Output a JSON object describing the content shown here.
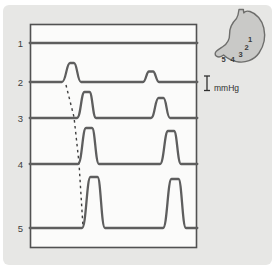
{
  "figure": {
    "colors": {
      "canvas_bg": "#e7e7e5",
      "chart_bg": "#fbfbfa",
      "panel_border": "#515151",
      "trace": "#5e5e5e",
      "dashed_line": "#3f3f3f",
      "text": "#3d3d3d",
      "stomach_fill": "#c9c9c7",
      "stomach_stroke": "#6e6e6c"
    },
    "stomach": {
      "numbers": [
        {
          "label": "1",
          "x": 250.0,
          "y": 41.5
        },
        {
          "label": "2",
          "x": 246.5,
          "y": 50.0
        },
        {
          "label": "3",
          "x": 240.5,
          "y": 57.0
        },
        {
          "label": "4",
          "x": 232.5,
          "y": 61.5
        },
        {
          "label": "5",
          "x": 223.5,
          "y": 61.5
        }
      ]
    },
    "scale_bar": {
      "label": "mmHg",
      "x": 207,
      "y1": 76,
      "y2": 90.5,
      "cap_half_width": 3,
      "label_x": 214,
      "label_y": 91
    }
  },
  "chart_data": {
    "type": "line",
    "title": "",
    "panel": {
      "x0": 30.5,
      "y0": 24.5,
      "x1": 196.5,
      "y1": 247.5
    },
    "traces": [
      {
        "site": "1",
        "label": "1",
        "baseline_y": 43,
        "waves": []
      },
      {
        "site": "2",
        "label": "2",
        "baseline_y": 82,
        "waves": [
          {
            "center_x": 72,
            "amplitude": 19,
            "half_width_left": 10,
            "half_width_right": 9,
            "crest": 2
          },
          {
            "center_x": 151,
            "amplitude": 10.5,
            "half_width_left": 8,
            "half_width_right": 8,
            "crest": 2
          }
        ]
      },
      {
        "site": "3",
        "label": "3",
        "baseline_y": 118,
        "waves": [
          {
            "center_x": 87,
            "amplitude": 26,
            "half_width_left": 10,
            "half_width_right": 9,
            "crest": 2.5
          },
          {
            "center_x": 161,
            "amplitude": 20,
            "half_width_left": 10,
            "half_width_right": 9,
            "crest": 2.5
          }
        ]
      },
      {
        "site": "4",
        "label": "4",
        "baseline_y": 164,
        "waves": [
          {
            "center_x": 89,
            "amplitude": 36,
            "half_width_left": 11,
            "half_width_right": 10,
            "crest": 3
          },
          {
            "center_x": 171,
            "amplitude": 33,
            "half_width_left": 11,
            "half_width_right": 10,
            "crest": 3
          }
        ]
      },
      {
        "site": "5",
        "label": "5",
        "baseline_y": 228,
        "waves": [
          {
            "center_x": 94,
            "amplitude": 51,
            "half_width_left": 12,
            "half_width_right": 11,
            "crest": 3.5
          },
          {
            "center_x": 175,
            "amplitude": 49,
            "half_width_left": 12,
            "half_width_right": 11,
            "crest": 3.5
          }
        ]
      }
    ],
    "label_x": 23,
    "propagation_line": {
      "points": [
        [
          66,
          85
        ],
        [
          74,
          117
        ],
        [
          79,
          163
        ],
        [
          83,
          227
        ]
      ]
    }
  }
}
